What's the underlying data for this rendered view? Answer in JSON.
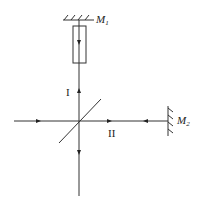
{
  "diagram": {
    "type": "michelson-interferometer",
    "mirrors": [
      {
        "id": "M1",
        "label": "M",
        "subscript": "1",
        "orientation": "horizontal"
      },
      {
        "id": "M2",
        "label": "M",
        "subscript": "2",
        "orientation": "vertical"
      }
    ],
    "arms": [
      {
        "id": "I",
        "label": "I"
      },
      {
        "id": "II",
        "label": "II"
      }
    ],
    "components": [
      "light source beam (left)",
      "beam splitter (diagonal)",
      "compensator plate (rectangle in arm I)",
      "detector output (bottom)"
    ],
    "line_color": "#333333",
    "background": "#ffffff"
  }
}
